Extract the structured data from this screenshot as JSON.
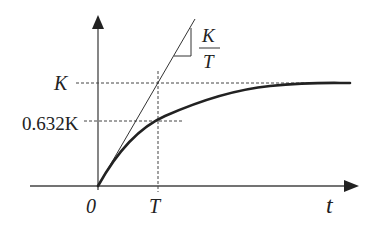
{
  "diagram": {
    "colors": {
      "stroke": "#333333",
      "text": "#222222",
      "background": "#ffffff"
    },
    "axes": {
      "x_label": "t",
      "origin_label": "0",
      "x_tick_label": "T"
    },
    "y_labels": {
      "final": "K",
      "at_T": "0.632K"
    },
    "slope_annotation": {
      "numerator": "K",
      "denominator": "T"
    },
    "curve": "K(1 - e^(-t/T))"
  }
}
